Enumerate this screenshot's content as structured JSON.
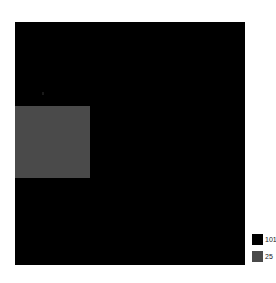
{
  "figure": {
    "background_color": "#ffffff",
    "panel": {
      "x": 15,
      "y": 22,
      "width": 230,
      "height": 243,
      "border_color": "#000000"
    }
  },
  "legend": {
    "position": "bottom-right",
    "items": [
      {
        "label": "101",
        "color": "#000000",
        "name": "legend-item-101"
      },
      {
        "label": "25",
        "color": "#4a4a4a",
        "name": "legend-item-25"
      }
    ]
  },
  "chart_data": {
    "type": "heatmap",
    "title": "",
    "subtitle": "",
    "xlabel": "",
    "ylabel": "",
    "grid": false,
    "legend_position": "bottom-right",
    "categorical": true,
    "classes": [
      {
        "value": "101",
        "color": "#000000",
        "description": "background class filling the entire panel"
      },
      {
        "value": "25",
        "color": "#4a4a4a",
        "description": "rectangular patch in the upper-left region"
      }
    ],
    "tick_labels": {
      "x": [],
      "y": []
    },
    "xlim": [
      0,
      230
    ],
    "ylim": [
      0,
      243
    ],
    "regions": [
      {
        "class": "101",
        "color": "#000000",
        "x": 0,
        "y": 0,
        "width": 230,
        "height": 243
      },
      {
        "class": "25",
        "color": "#4a4a4a",
        "x": 0,
        "y": 84,
        "width": 75,
        "height": 72
      }
    ]
  }
}
